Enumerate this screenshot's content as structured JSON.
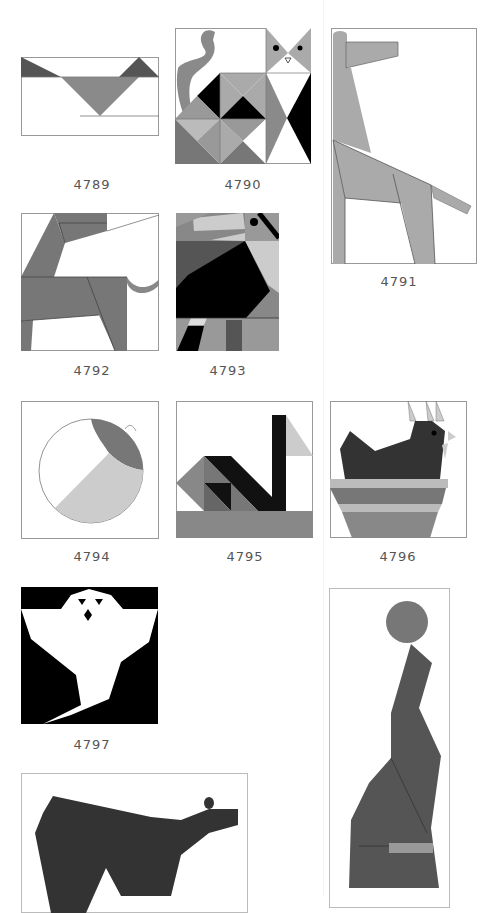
{
  "colors": {
    "mid_gray": "#8a8a8a",
    "dark_gray": "#555555",
    "light_gray": "#c8c8c8",
    "charcoal": "#3a3a3a",
    "black": "#000000",
    "border": "#9a9a9a"
  },
  "blocks": [
    {
      "id": "4789",
      "caption": "4789",
      "subject": "bird-wings"
    },
    {
      "id": "4790",
      "caption": "4790",
      "subject": "cat-and-owl"
    },
    {
      "id": "4791",
      "caption": "4791",
      "subject": "giraffe"
    },
    {
      "id": "4792",
      "caption": "4792",
      "subject": "horse"
    },
    {
      "id": "4793",
      "caption": "4793",
      "subject": "toucan"
    },
    {
      "id": "4794",
      "caption": "4794",
      "subject": "ball"
    },
    {
      "id": "4795",
      "caption": "4795",
      "subject": "swan"
    },
    {
      "id": "4796",
      "caption": "4796",
      "subject": "hen-on-nest"
    },
    {
      "id": "4797",
      "caption": "4797",
      "subject": "ghost"
    },
    {
      "id": "4798",
      "caption": "",
      "subject": "bear"
    },
    {
      "id": "4799",
      "caption": "",
      "subject": "seal-with-ball"
    }
  ]
}
